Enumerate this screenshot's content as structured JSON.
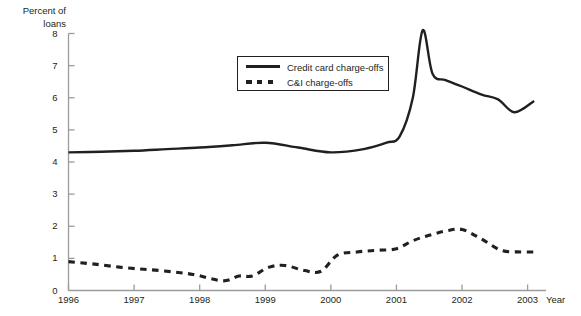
{
  "chart_data": {
    "type": "line",
    "title": "",
    "subtitle": "",
    "ylabel": "Percent of\nloans",
    "xlabel": "Year",
    "ylim": [
      0,
      8
    ],
    "xlim": [
      1996,
      2003.25
    ],
    "grid": false,
    "legend_position": "inside-top-center",
    "yticks": [
      "0",
      "1",
      "2",
      "3",
      "4",
      "5",
      "6",
      "7",
      "8"
    ],
    "ytick_values": [
      0,
      1,
      2,
      3,
      4,
      5,
      6,
      7,
      8
    ],
    "xticks": [
      "1996",
      "1997",
      "1998",
      "1999",
      "2000",
      "2001",
      "2002",
      "2003"
    ],
    "xtick_values": [
      1996,
      1997,
      1998,
      1999,
      2000,
      2001,
      2002,
      2003
    ],
    "series": [
      {
        "name": "Credit card charge-offs",
        "style": "solid",
        "color": "#231f20",
        "x": [
          1996.0,
          1996.5,
          1997.0,
          1997.5,
          1998.0,
          1998.5,
          1999.0,
          1999.5,
          2000.0,
          2000.5,
          2000.85,
          2001.05,
          2001.25,
          2001.4,
          2001.55,
          2001.75,
          2002.0,
          2002.3,
          2002.55,
          2002.8,
          2003.1
        ],
        "values": [
          4.3,
          4.32,
          4.35,
          4.4,
          4.45,
          4.52,
          4.6,
          4.45,
          4.3,
          4.4,
          4.6,
          4.8,
          6.0,
          8.1,
          6.75,
          6.55,
          6.35,
          6.1,
          5.95,
          5.55,
          5.9
        ]
      },
      {
        "name": "C&I charge-offs",
        "style": "dashed",
        "color": "#231f20",
        "x": [
          1996.0,
          1996.4,
          1996.9,
          1997.4,
          1997.9,
          1998.35,
          1998.6,
          1998.8,
          1999.05,
          1999.3,
          1999.6,
          1999.85,
          2000.1,
          2000.4,
          2000.7,
          2001.0,
          2001.25,
          2001.5,
          2001.75,
          2002.0,
          2002.3,
          2002.6,
          2002.9,
          2003.1
        ],
        "values": [
          0.9,
          0.82,
          0.7,
          0.62,
          0.5,
          0.3,
          0.45,
          0.45,
          0.72,
          0.78,
          0.62,
          0.6,
          1.1,
          1.2,
          1.25,
          1.3,
          1.55,
          1.72,
          1.85,
          1.9,
          1.6,
          1.25,
          1.2,
          1.2
        ]
      }
    ],
    "annotations": []
  },
  "legend": {
    "credit_card_label": "Credit card charge-offs",
    "ci_label": "C&I charge-offs"
  },
  "axes": {
    "y_title": "Percent of\nloans",
    "x_title": "Year"
  }
}
